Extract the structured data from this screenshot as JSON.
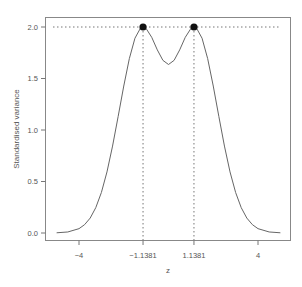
{
  "chart_data": {
    "type": "line",
    "title": "",
    "xlabel": "z",
    "ylabel": "Standardised variance",
    "xlim": [
      -5.4,
      5.4
    ],
    "ylim": [
      -0.08,
      2.08
    ],
    "grid": false,
    "legend": null,
    "x_ticks": [
      {
        "value": -4,
        "label": "−4"
      },
      {
        "value": -1.1381,
        "label": "−1.1381"
      },
      {
        "value": 1.1381,
        "label": "1.1381"
      },
      {
        "value": 4,
        "label": "4"
      }
    ],
    "y_ticks": [
      {
        "value": 0.0,
        "label": "0.0"
      },
      {
        "value": 0.5,
        "label": "0.5"
      },
      {
        "value": 1.0,
        "label": "1.0"
      },
      {
        "value": 1.5,
        "label": "1.5"
      },
      {
        "value": 2.0,
        "label": "2.0"
      }
    ],
    "series": [
      {
        "name": "standardised variance",
        "color": "#555555",
        "x": [
          -5.0,
          -4.5,
          -4.0,
          -3.75,
          -3.5,
          -3.25,
          -3.0,
          -2.75,
          -2.5,
          -2.25,
          -2.0,
          -1.75,
          -1.5,
          -1.25,
          -1.1381,
          -1.0,
          -0.75,
          -0.5,
          -0.25,
          0.0,
          0.25,
          0.5,
          0.75,
          1.0,
          1.1381,
          1.25,
          1.5,
          1.75,
          2.0,
          2.25,
          2.5,
          2.75,
          3.0,
          3.25,
          3.5,
          3.75,
          4.0,
          4.5,
          5.0
        ],
        "y": [
          0.002,
          0.01,
          0.042,
          0.081,
          0.145,
          0.246,
          0.393,
          0.593,
          0.844,
          1.132,
          1.427,
          1.693,
          1.891,
          1.99,
          2.0,
          1.985,
          1.9,
          1.778,
          1.676,
          1.636,
          1.676,
          1.778,
          1.9,
          1.985,
          2.0,
          1.99,
          1.891,
          1.693,
          1.427,
          1.132,
          0.844,
          0.593,
          0.393,
          0.246,
          0.145,
          0.081,
          0.042,
          0.01,
          0.002
        ]
      }
    ],
    "points": [
      {
        "x": -1.1381,
        "y": 2.0
      },
      {
        "x": 1.1381,
        "y": 2.0
      }
    ],
    "reference_lines": [
      {
        "type": "horizontal",
        "y": 2.0,
        "style": "dotted"
      },
      {
        "type": "vertical",
        "x": -1.1381,
        "style": "dotted"
      },
      {
        "type": "vertical",
        "x": 1.1381,
        "style": "dotted"
      }
    ]
  }
}
